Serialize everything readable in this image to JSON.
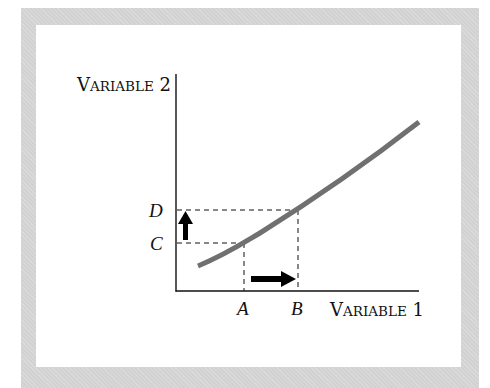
{
  "diagram": {
    "y_axis_label": {
      "big": "V",
      "small": "ARIABLE",
      "num": " 2"
    },
    "x_axis_label": {
      "big": "V",
      "small": "ARIABLE",
      "num": " 1"
    },
    "y_ticks": [
      "D",
      "C"
    ],
    "x_ticks": [
      "A",
      "B"
    ],
    "colors": {
      "frame": "#d2d2d2",
      "curve": "#707070",
      "axis": "#111111",
      "arrow": "#000000"
    },
    "curve": {
      "description": "upward-sloping, slightly convex curve",
      "points": [
        [
          198,
          266
        ],
        [
          244,
          243
        ],
        [
          298,
          210
        ],
        [
          419,
          122
        ]
      ]
    },
    "annotations": [
      {
        "type": "arrow",
        "direction": "up",
        "from": "C",
        "to": "D"
      },
      {
        "type": "arrow",
        "direction": "right",
        "from": "A",
        "to": "B"
      }
    ]
  }
}
